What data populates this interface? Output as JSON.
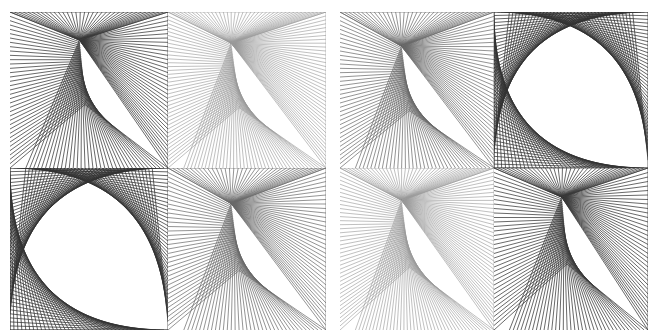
{
  "figure": {
    "background": "#ffffff",
    "groups": [
      {
        "name": "left-grid",
        "panels": [
          {
            "name": "top-left",
            "type": "fan",
            "focus": [
              0.44,
              0.18
            ],
            "color": "#3a3a3a",
            "opacity": 0.85,
            "count": 36,
            "kink": [
              0.08,
              0.9
            ]
          },
          {
            "name": "top-right",
            "type": "fan",
            "focus": [
              0.4,
              0.2
            ],
            "color": "#9a9a9a",
            "opacity": 0.7,
            "count": 40,
            "kink": [
              0.0,
              1.0
            ]
          },
          {
            "name": "bottom-left",
            "type": "curve",
            "color": "#333333",
            "opacity": 0.85,
            "count": 40
          },
          {
            "name": "bottom-right",
            "type": "fan",
            "focus": [
              0.4,
              0.22
            ],
            "color": "#6a6a6a",
            "opacity": 0.8,
            "count": 36,
            "kink": [
              0.0,
              1.0
            ]
          }
        ]
      },
      {
        "name": "right-grid",
        "panels": [
          {
            "name": "top-left",
            "type": "fan",
            "focus": [
              0.4,
              0.22
            ],
            "color": "#6a6a6a",
            "opacity": 0.8,
            "count": 36,
            "kink": [
              0.0,
              1.0
            ]
          },
          {
            "name": "top-right",
            "type": "curve",
            "color": "#333333",
            "opacity": 0.85,
            "count": 40
          },
          {
            "name": "bottom-left",
            "type": "fan",
            "focus": [
              0.4,
              0.2
            ],
            "color": "#9a9a9a",
            "opacity": 0.7,
            "count": 40,
            "kink": [
              0.0,
              1.0
            ]
          },
          {
            "name": "bottom-right",
            "type": "fan",
            "focus": [
              0.44,
              0.18
            ],
            "color": "#3a3a3a",
            "opacity": 0.85,
            "count": 36,
            "kink": [
              0.08,
              0.9
            ]
          }
        ]
      }
    ]
  }
}
